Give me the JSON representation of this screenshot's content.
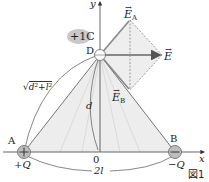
{
  "figure": {
    "caption": "図1",
    "axes": {
      "x_label": "x",
      "y_label": "y",
      "origin_label": "0"
    },
    "test_charge": {
      "label": "+1C",
      "point_label": "D"
    },
    "charges": [
      {
        "point_label": "A",
        "charge_label": "+Q",
        "sign": "+"
      },
      {
        "point_label": "B",
        "charge_label": "−Q",
        "sign": "−"
      }
    ],
    "distances": {
      "AD": "√d²+l²",
      "AD_radicand": "d²+l²",
      "OD": "d",
      "AB": "2l"
    },
    "vectors": {
      "EA": {
        "symbol": "E",
        "subscript": "A"
      },
      "EB": {
        "symbol": "E",
        "subscript": "B"
      },
      "E": {
        "symbol": "E",
        "subscript": ""
      }
    },
    "colors": {
      "line": "#555555",
      "shade": "#ededed",
      "charge_fill": "#bdbdbd",
      "pill": "#c9c9c9"
    }
  }
}
